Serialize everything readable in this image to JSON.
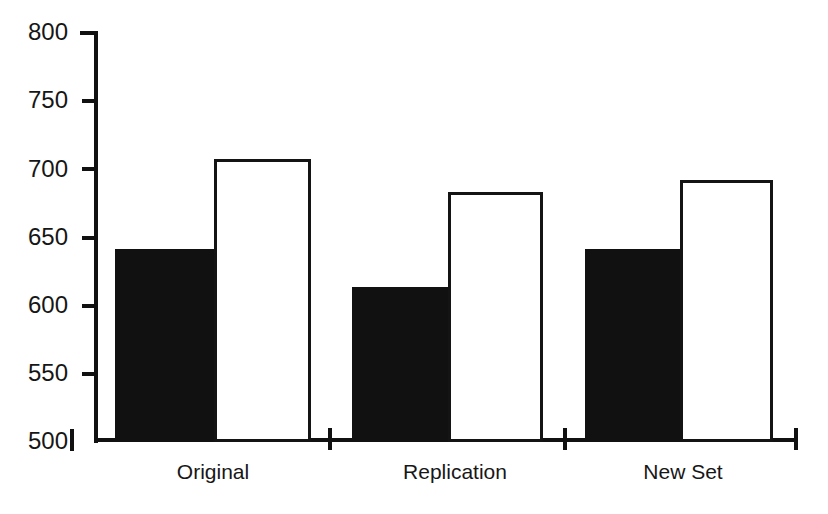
{
  "chart_data": {
    "type": "bar",
    "title": "",
    "subtitle": "",
    "xlabel": "",
    "ylabel": "",
    "categories": [
      "Original",
      "Replication",
      "New Set"
    ],
    "series": [
      {
        "name": "filled",
        "style": "solid-black",
        "color": "#111111",
        "values": [
          641,
          613,
          641
        ]
      },
      {
        "name": "hollow",
        "style": "outline-white",
        "color": "#ffffff",
        "values": [
          707,
          683,
          692
        ]
      }
    ],
    "ylim": [
      500,
      800
    ],
    "yticks": [
      500,
      550,
      600,
      650,
      700,
      750,
      800
    ],
    "ytick_labels": [
      "500",
      "550",
      "600",
      "650",
      "700",
      "750",
      "800"
    ],
    "grid": false,
    "legend": "none",
    "axis_color": "#111111",
    "background": "#ffffff"
  },
  "axis": {
    "labels": {
      "t800": "800",
      "t750": "750",
      "t700": "700",
      "t650": "650",
      "t600": "600",
      "t550": "550",
      "t500": "500"
    }
  },
  "categories": {
    "c0": "Original",
    "c1": "Replication",
    "c2": "New Set"
  }
}
